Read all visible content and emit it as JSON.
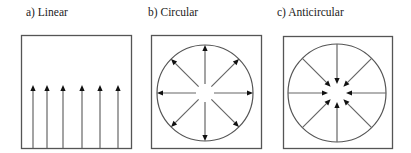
{
  "panels": [
    {
      "id": "a",
      "title": "a) Linear",
      "type": "linear",
      "title_pos": [
        26,
        6
      ],
      "box": {
        "x": 21,
        "y": 35,
        "w": 110,
        "h": 113
      },
      "arrows_x": [
        33,
        47,
        63,
        82,
        100,
        118
      ],
      "arrow_tip_y": 85,
      "arrow_base_y": 148
    },
    {
      "id": "b",
      "title": "b) Circular",
      "type": "outward",
      "title_pos": [
        148,
        6
      ],
      "box": {
        "x": 151,
        "y": 35,
        "w": 110,
        "h": 113
      },
      "circle": {
        "cx": 205,
        "cy": 93,
        "r": 48
      },
      "inner_radius": 9,
      "directions": 8
    },
    {
      "id": "c",
      "title": "c) Anticircular",
      "type": "inward",
      "title_pos": [
        277,
        6
      ],
      "box": {
        "x": 283,
        "y": 36,
        "w": 109,
        "h": 112
      },
      "circle": {
        "cx": 337,
        "cy": 93,
        "r": 49
      },
      "inner_radius": 9,
      "directions": 8
    }
  ],
  "colors": {
    "line": "#666666",
    "arrowhead": "#111111",
    "box": "#555555",
    "text": "#222222"
  }
}
